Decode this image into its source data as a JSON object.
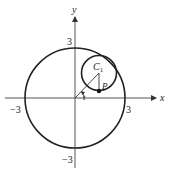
{
  "diagram": {
    "axes": {
      "x_label": "x",
      "y_label": "y"
    },
    "ticks": {
      "x_pos": "3",
      "x_neg": "−3",
      "y_pos": "3",
      "y_neg": "−3"
    },
    "outer_circle": {
      "radius": 3,
      "center": [
        0,
        0
      ]
    },
    "inner_circle": {
      "label_main": "C",
      "label_sub": "1"
    },
    "point_label": "P",
    "angle_label": "t",
    "colors": {
      "stroke": "#222222",
      "background": "#ffffff"
    }
  }
}
